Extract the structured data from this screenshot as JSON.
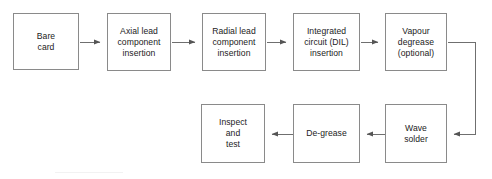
{
  "diagram": {
    "type": "flowchart",
    "colors": {
      "box_border": "#8a8a8a",
      "text": "#222222",
      "edge": "#6f6f6f",
      "background": "#ffffff"
    },
    "nodes": [
      {
        "id": "bare-card",
        "label": "Bare\ncard",
        "x": 13,
        "y": 13,
        "w": 66,
        "h": 57
      },
      {
        "id": "axial-lead",
        "label": "Axial lead\ncomponent\ninsertion",
        "x": 107,
        "y": 13,
        "w": 64,
        "h": 58
      },
      {
        "id": "radial-lead",
        "label": "Radial lead\ncomponent\ninsertion",
        "x": 202,
        "y": 13,
        "w": 64,
        "h": 58
      },
      {
        "id": "integrated-circuit",
        "label": "Integrated\ncircuit (DIL)\ninsertion",
        "x": 293,
        "y": 13,
        "w": 67,
        "h": 58
      },
      {
        "id": "vapour-degrease",
        "label": "Vapour\ndegrease\n(optional)",
        "x": 385,
        "y": 13,
        "w": 62,
        "h": 58
      },
      {
        "id": "inspect-and-test",
        "label": "Inspect\nand\ntest",
        "x": 201,
        "y": 104,
        "w": 64,
        "h": 59
      },
      {
        "id": "de-grease",
        "label": "De-grease",
        "x": 293,
        "y": 104,
        "w": 67,
        "h": 59
      },
      {
        "id": "wave-solder",
        "label": "Wave\nsolder",
        "x": 385,
        "y": 104,
        "w": 62,
        "h": 59
      }
    ],
    "edges": [
      {
        "id": "edge-bare-to-axial",
        "from": "bare-card",
        "to": "axial-lead",
        "direction": "right"
      },
      {
        "id": "edge-axial-to-radial",
        "from": "axial-lead",
        "to": "radial-lead",
        "direction": "right"
      },
      {
        "id": "edge-radial-to-ic",
        "from": "radial-lead",
        "to": "integrated-circuit",
        "direction": "right"
      },
      {
        "id": "edge-ic-to-vapour",
        "from": "integrated-circuit",
        "to": "vapour-degrease",
        "direction": "right"
      },
      {
        "id": "edge-vapour-to-wave",
        "from": "vapour-degrease",
        "to": "wave-solder",
        "direction": "wrap-down-left"
      },
      {
        "id": "edge-wave-to-degrease",
        "from": "wave-solder",
        "to": "de-grease",
        "direction": "left"
      },
      {
        "id": "edge-degrease-to-inspect",
        "from": "de-grease",
        "to": "inspect-and-test",
        "direction": "left"
      }
    ]
  }
}
